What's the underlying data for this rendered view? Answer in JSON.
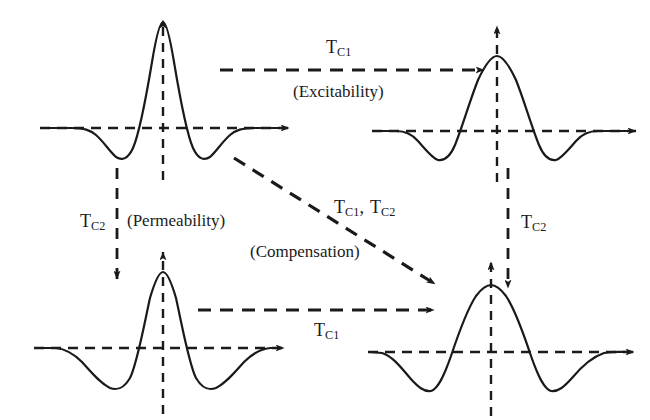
{
  "figure": {
    "type": "transformation-diagram",
    "background_color": "#ffffff",
    "ink_color": "#1a1a1a"
  },
  "panels": [
    {
      "id": "top-left",
      "name": "wavelet-top-left",
      "position": "top-left",
      "origin_x": 163,
      "baseline_y": 128,
      "peak_amplitude": 112,
      "trough_amplitude": 30,
      "width_scale": 0.62,
      "axis_x_start": 40,
      "axis_x_end": 295,
      "axis_y_top": 14
    },
    {
      "id": "top-right",
      "name": "wavelet-top-right",
      "position": "top-right",
      "origin_x": 497,
      "baseline_y": 131,
      "peak_amplitude": 74,
      "trough_amplitude": 26,
      "width_scale": 0.7,
      "axis_x_start": 372,
      "axis_x_end": 640,
      "axis_y_top": 18
    },
    {
      "id": "bottom-left",
      "name": "wavelet-bottom-left",
      "position": "bottom-left",
      "origin_x": 163,
      "baseline_y": 348,
      "peak_amplitude": 92,
      "trough_amplitude": 42,
      "width_scale": 1.0,
      "axis_x_start": 34,
      "axis_x_end": 290,
      "axis_y_top": 248
    },
    {
      "id": "bottom-right",
      "name": "wavelet-bottom-right",
      "position": "bottom-right",
      "origin_x": 491,
      "baseline_y": 352,
      "peak_amplitude": 60,
      "trough_amplitude": 40,
      "width_scale": 1.05,
      "axis_x_start": 368,
      "axis_x_end": 638,
      "axis_y_top": 258
    }
  ],
  "arrows": [
    {
      "id": "arrow-top",
      "name": "arrow-excitability",
      "orientation": "horizontal",
      "from": "top-left",
      "to": "top-right",
      "x1": 220,
      "y1": 70,
      "x2": 488,
      "y2": 70
    },
    {
      "id": "arrow-left",
      "name": "arrow-permeability",
      "orientation": "vertical",
      "from": "top-left",
      "to": "bottom-left",
      "x1": 117,
      "y1": 168,
      "x2": 117,
      "y2": 283
    },
    {
      "id": "arrow-diagonal",
      "name": "arrow-compensation",
      "orientation": "diagonal",
      "from": "top-left",
      "to": "bottom-right",
      "x1": 234,
      "y1": 158,
      "x2": 440,
      "y2": 287
    },
    {
      "id": "arrow-right",
      "name": "arrow-tc2-right",
      "orientation": "vertical",
      "from": "top-right",
      "to": "bottom-right",
      "x1": 508,
      "y1": 168,
      "x2": 508,
      "y2": 292
    },
    {
      "id": "arrow-bottom",
      "name": "arrow-tc1-bottom",
      "orientation": "horizontal",
      "from": "bottom-left",
      "to": "bottom-right",
      "x1": 198,
      "y1": 310,
      "x2": 438,
      "y2": 310
    }
  ],
  "labels": {
    "top_symbol": "T",
    "top_subscript": "C1",
    "top_caption": "(Excitability)",
    "left_symbol": "T",
    "left_subscript": "C2",
    "left_caption": "(Permeability)",
    "diagonal_symbol_1": "T",
    "diagonal_subscript_1": "C1",
    "diagonal_separator": ",",
    "diagonal_symbol_2": "T",
    "diagonal_subscript_2": "C2",
    "diagonal_caption": "(Compensation)",
    "right_symbol": "T",
    "right_subscript": "C2",
    "bottom_symbol": "T",
    "bottom_subscript": "C1"
  }
}
